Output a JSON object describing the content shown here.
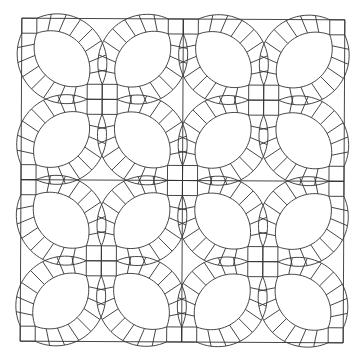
{
  "diagram": {
    "title": "Double Wedding Ring quilt pattern",
    "type": "quilt-block-line-drawing",
    "layout": {
      "rows": 2,
      "cols": 2,
      "outer_square": {
        "x": 21,
        "y": 19,
        "size": 323
      },
      "rotation_deg": 0.3
    },
    "block": {
      "center_cluster": "2x2 squares",
      "corner_squares": 4,
      "melons_per_block": 4,
      "segments_per_arc": 8
    },
    "colors": {
      "line": "#333333",
      "background": "#ffffff"
    }
  }
}
